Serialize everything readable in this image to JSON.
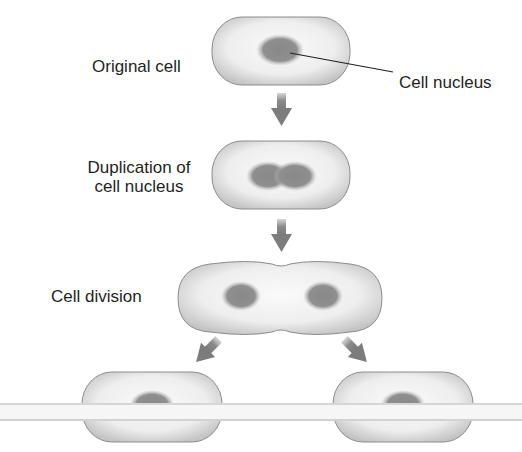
{
  "diagram": {
    "labels": {
      "original_cell": "Original cell",
      "cell_nucleus": "Cell nucleus",
      "duplication_line1": "Duplication of",
      "duplication_line2": "cell nucleus",
      "cell_division": "Cell division"
    },
    "stages": [
      {
        "name": "Original cell",
        "nuclei": 1
      },
      {
        "name": "Duplication of cell nucleus",
        "nuclei": 1
      },
      {
        "name": "Cell division",
        "nuclei": 2
      },
      {
        "name": "Daughter cells",
        "nuclei": 2
      }
    ],
    "colors": {
      "cell_fill": "#ededed",
      "cell_edge": "#8c8c8c",
      "nucleus": "#8a8a8a",
      "arrow": "#808080",
      "text": "#1f1f1f",
      "band": "#f4f4f4"
    }
  }
}
